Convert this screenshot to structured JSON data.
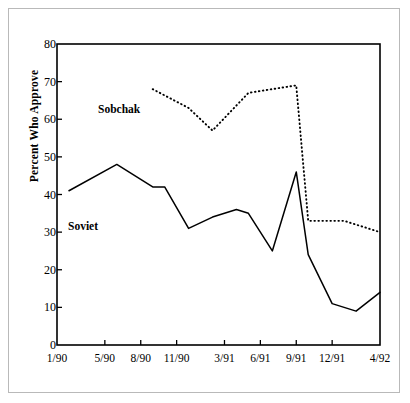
{
  "chart_data": {
    "type": "line",
    "title": "",
    "xlabel": "",
    "ylabel": "Percent Who Approve",
    "ylim": [
      0,
      80
    ],
    "yticks": [
      0,
      10,
      20,
      30,
      40,
      50,
      60,
      70,
      80
    ],
    "grid": false,
    "legend": "inline-annotations",
    "x_tick_labels": [
      "1/90",
      "5/90",
      "8/90",
      "11/90",
      "3/91",
      "6/91",
      "9/91",
      "12/91",
      "4/92"
    ],
    "x_tick_positions": [
      0,
      4,
      7,
      10,
      14,
      17,
      20,
      23,
      27
    ],
    "x_index_range": [
      0,
      27
    ],
    "series": [
      {
        "name": "Soviet",
        "style": "solid",
        "color": "#000000",
        "x": [
          1,
          5,
          8,
          9,
          11,
          13,
          15,
          16,
          18,
          20,
          21,
          23,
          25,
          27
        ],
        "values": [
          41,
          48,
          42,
          42,
          31,
          34,
          36,
          35,
          25,
          46,
          24,
          11,
          9,
          14
        ]
      },
      {
        "name": "Sobchak",
        "style": "dotted",
        "color": "#000000",
        "x": [
          8,
          11,
          13,
          16,
          18,
          20,
          21,
          24,
          27
        ],
        "values": [
          68,
          63,
          57,
          67,
          68,
          69,
          33,
          33,
          30
        ]
      }
    ],
    "annotations": [
      {
        "text": "Sobchak",
        "x": 4.5,
        "y": 61
      },
      {
        "text": "Soviet",
        "x": 1.5,
        "y": 31
      }
    ]
  },
  "axis": {
    "y_title": "Percent Who Approve"
  }
}
